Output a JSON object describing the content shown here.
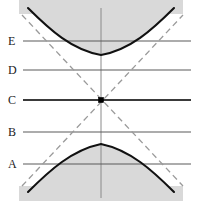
{
  "figure": {
    "type": "math-diagram",
    "width": 198,
    "height": 201,
    "background_color": "#ffffff",
    "shading_color": "#d9d9d9",
    "curve_color": "#111111",
    "asymptote_color": "#9a9a9a",
    "level_line_color": "#5b5b5b",
    "axis_color": "#8a8a8a"
  },
  "axes": {
    "vertical_axis": {
      "x": 101,
      "y_top": 8,
      "y_bottom": 198
    }
  },
  "center_point": {
    "x": 101,
    "y": 100,
    "label": ""
  },
  "levels": [
    {
      "label": "E",
      "y": 41,
      "label_x": 8,
      "x_start": 23,
      "x_end": 191,
      "emphasis": "normal"
    },
    {
      "label": "D",
      "y": 70,
      "label_x": 8,
      "x_start": 23,
      "x_end": 191,
      "emphasis": "normal"
    },
    {
      "label": "C",
      "y": 100,
      "label_x": 8,
      "x_start": 23,
      "x_end": 191,
      "emphasis": "strong"
    },
    {
      "label": "B",
      "y": 132,
      "label_x": 8,
      "x_start": 23,
      "x_end": 191,
      "emphasis": "normal"
    },
    {
      "label": "A",
      "y": 164,
      "label_x": 8,
      "x_start": 23,
      "x_end": 191,
      "emphasis": "normal"
    }
  ],
  "asymptotes": [
    {
      "name": "asymptote-down-right",
      "x1": 22,
      "y1": 15,
      "x2": 183,
      "y2": 186
    },
    {
      "name": "asymptote-up-right",
      "x1": 22,
      "y1": 186,
      "x2": 183,
      "y2": 15
    }
  ],
  "curves": [
    {
      "name": "upper-branch",
      "vertex": {
        "x": 101,
        "y": 55
      },
      "path": "M 28,8 C 50,30 72,50 101,55 C 130,50 152,30 174,8",
      "shaded_region": "M 28,8 C 50,30 72,50 101,55 C 130,50 152,30 174,8 L 183,13 L 19,13 Z"
    },
    {
      "name": "lower-branch",
      "vertex": {
        "x": 101,
        "y": 144
      },
      "path": "M 28,192 C 50,170 72,150 101,144 C 130,150 152,170 174,192",
      "shaded_region": "M 28,192 C 50,170 72,150 101,144 C 130,150 152,170 174,192 L 183,187 L 19,187 Z"
    }
  ],
  "shaded_bands": {
    "top": {
      "y_start": 13,
      "y_end": 0
    },
    "bottom": {
      "y_start": 187,
      "y_end": 201
    }
  }
}
